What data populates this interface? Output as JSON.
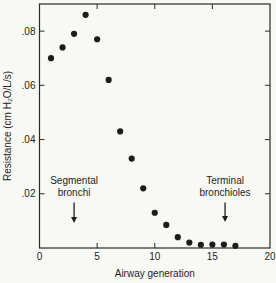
{
  "chart_data": {
    "type": "scatter",
    "title": "",
    "xlabel": "Airway generation",
    "ylabel": "Resistance (cm H₂O/L/s)",
    "xlim": [
      0,
      20
    ],
    "ylim": [
      0,
      0.09
    ],
    "x_ticks": [
      0,
      5,
      10,
      15,
      20
    ],
    "x_tick_labels": [
      "0",
      "5",
      "10",
      "15",
      "20"
    ],
    "y_ticks": [
      0.02,
      0.04,
      0.06,
      0.08
    ],
    "y_tick_labels": [
      ".02",
      ".04",
      ".06",
      ".08"
    ],
    "grid": false,
    "legend": null,
    "marker": {
      "shape": "circle",
      "color": "#1c1c1c",
      "radius": 3.1
    },
    "frame_color": "#2a2a2a",
    "points": [
      {
        "x": 1,
        "y": 0.07
      },
      {
        "x": 2,
        "y": 0.074
      },
      {
        "x": 3,
        "y": 0.079
      },
      {
        "x": 4,
        "y": 0.086
      },
      {
        "x": 5,
        "y": 0.077
      },
      {
        "x": 6,
        "y": 0.062
      },
      {
        "x": 7,
        "y": 0.043
      },
      {
        "x": 8,
        "y": 0.033
      },
      {
        "x": 9,
        "y": 0.022
      },
      {
        "x": 10,
        "y": 0.013
      },
      {
        "x": 11,
        "y": 0.0085
      },
      {
        "x": 12,
        "y": 0.004
      },
      {
        "x": 13,
        "y": 0.002
      },
      {
        "x": 14,
        "y": 0.0012
      },
      {
        "x": 15,
        "y": 0.0013
      },
      {
        "x": 16,
        "y": 0.0013
      },
      {
        "x": 17,
        "y": 0.0008
      }
    ],
    "annotations": [
      {
        "name": "segmental-bronchi",
        "lines": [
          "Segmental",
          "bronchi"
        ],
        "x": 3,
        "text_y": 0.0235,
        "arrow_start_y": 0.0168,
        "arrow_end_y": 0.0092
      },
      {
        "name": "terminal-bronchioles",
        "lines": [
          "Terminal",
          "bronchioles"
        ],
        "x": 16.1,
        "text_y": 0.0235,
        "arrow_start_y": 0.0168,
        "arrow_end_y": 0.0096
      }
    ]
  }
}
